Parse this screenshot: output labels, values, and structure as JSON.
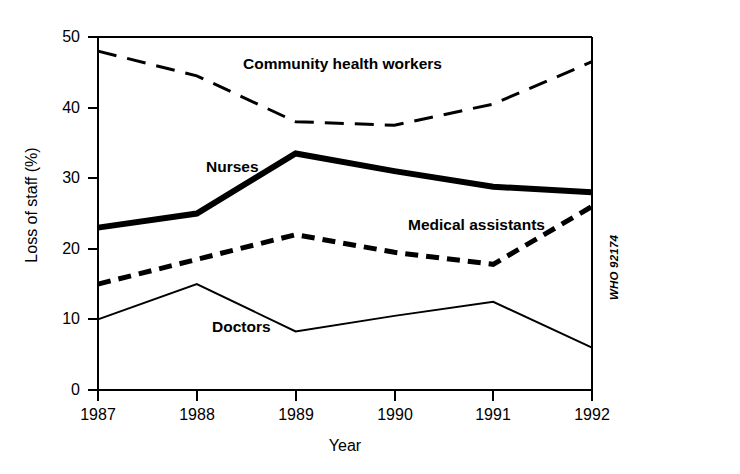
{
  "chart_data": {
    "type": "line",
    "title": "",
    "xlabel": "Year",
    "ylabel": "Loss of staff (%)",
    "x": [
      1987,
      1988,
      1989,
      1990,
      1991,
      1992
    ],
    "categories": [
      "1987",
      "1988",
      "1989",
      "1990",
      "1991",
      "1992"
    ],
    "xlim": [
      1987,
      1992
    ],
    "ylim": [
      0,
      50
    ],
    "yticks": [
      0,
      10,
      20,
      30,
      40,
      50
    ],
    "ytick_labels": [
      "0",
      "10",
      "20",
      "30",
      "40",
      "50"
    ],
    "xtick_labels": [
      "1987",
      "1988",
      "1989",
      "1990",
      "1991",
      "1992"
    ],
    "grid": false,
    "legend_position": "inline-labels",
    "series": [
      {
        "name": "Community health workers",
        "values": [
          48,
          44.5,
          38,
          37.5,
          40.5,
          46.5
        ],
        "style": "long-dashed",
        "color": "#000000",
        "width": 3
      },
      {
        "name": "Nurses",
        "values": [
          23,
          25,
          33.5,
          31,
          28.8,
          28
        ],
        "style": "solid",
        "color": "#000000",
        "width": 6
      },
      {
        "name": "Medical assistants",
        "values": [
          15,
          18.5,
          22,
          19.5,
          17.8,
          26
        ],
        "style": "short-dashed",
        "color": "#000000",
        "width": 5
      },
      {
        "name": "Doctors",
        "values": [
          10,
          15,
          8.3,
          10.5,
          12.5,
          6
        ],
        "style": "solid",
        "color": "#000000",
        "width": 2
      }
    ],
    "annotations": [
      {
        "text": "Community health workers",
        "x": 1989.0,
        "y": 45.5
      },
      {
        "text": "Nurses",
        "x": 1988.2,
        "y": 31.7
      },
      {
        "text": "Medical assistants",
        "x": 1990.2,
        "y": 23.2
      },
      {
        "text": "Doctors",
        "x": 1988.3,
        "y": 9.7
      }
    ],
    "source_code": "WHO 92174"
  }
}
